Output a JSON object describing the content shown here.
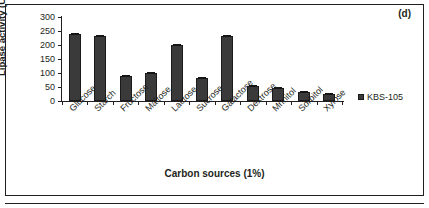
{
  "panel": {
    "label": "(d)"
  },
  "chart_data": {
    "type": "bar",
    "title": "",
    "subtitle": "",
    "xlabel": "Carbon sources (1%)",
    "ylabel": "Lipase activity (U/ml)",
    "categories": [
      "Glucose",
      "Starch",
      "Fructose",
      "Maltose",
      "Lactose",
      "Sucrose",
      "Galactose",
      "Dextrose",
      "Mnnitol",
      "Sorbitol",
      "Xylose"
    ],
    "series": [
      {
        "name": "KBS-105",
        "values": [
          238,
          232,
          91,
          100,
          201,
          83,
          232,
          53,
          45,
          31,
          24
        ],
        "color": "#3a3a3a"
      }
    ],
    "values": [
      238,
      232,
      91,
      100,
      201,
      83,
      232,
      53,
      45,
      31,
      24
    ],
    "ylim": [
      0,
      300
    ],
    "ytick_step": 50,
    "yticks": [
      "300",
      "250",
      "200",
      "150",
      "100",
      "50",
      "0"
    ],
    "ytick_values": [
      300,
      250,
      200,
      150,
      100,
      50,
      0
    ],
    "grid": false,
    "legend": {
      "position": "right",
      "entries": [
        {
          "label": "KBS-105",
          "color": "#3a3a3a",
          "marker": "square-marker"
        }
      ]
    },
    "xtick_rotation": -45,
    "bar_color": "#3a3a3a",
    "axis_color": "#231f20",
    "background": "#ffffff",
    "error_bars": true
  }
}
